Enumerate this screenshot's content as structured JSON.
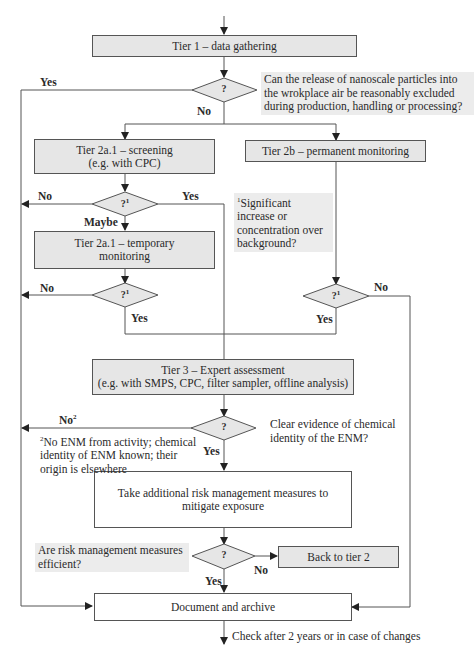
{
  "flowchart": {
    "tier1": {
      "label": "Tier 1 – data gathering"
    },
    "q1": {
      "symbol": "?",
      "question": "Can the release of nanoscale particles into the wrokplace air be reasonably excluded during production, handling or processing?",
      "yes": "Yes",
      "no": "No"
    },
    "tier2a_screening": {
      "line1": "Tier 2a.1 – screening",
      "line2": "(e.g. with CPC)"
    },
    "tier2b": {
      "label": "Tier 2b – permanent monitoring"
    },
    "q2": {
      "symbol": "?",
      "sup": "1",
      "no": "No",
      "yes": "Yes",
      "maybe": "Maybe"
    },
    "footnote1": {
      "sup": "1",
      "text": "Significant increase or concentration over background?"
    },
    "tier2a_temp": {
      "line1": "Tier 2a.1 – temporary",
      "line2": "monitoring"
    },
    "q3": {
      "symbol": "?",
      "sup": "1",
      "no": "No",
      "yes": "Yes"
    },
    "q4": {
      "symbol": "?",
      "sup": "1",
      "no": "No",
      "yes": "Yes"
    },
    "tier3": {
      "line1": "Tier 3 – Expert assessment",
      "line2": "(e.g. with SMPS, CPC, filter sampler, offline analysis)"
    },
    "q5": {
      "symbol": "?",
      "question": "Clear evidence of chemical identity of the ENM?",
      "no": "No",
      "no_sup": "2",
      "yes": "Yes"
    },
    "footnote2": {
      "sup": "2",
      "text": "No ENM from activity; chemical identity of ENM known; their origin is elsewhere"
    },
    "measures": {
      "line1": "Take additional risk management measures to",
      "line2": "mitigate exposure"
    },
    "q6": {
      "symbol": "?",
      "question": "Are risk management measures efficient?",
      "no": "No",
      "yes": "Yes"
    },
    "back": {
      "label": "Back to tier 2"
    },
    "document": {
      "label": "Document and archive"
    },
    "check": {
      "label": "Check after 2 years or in case of changes"
    }
  },
  "colors": {
    "box_fill": "#e6e6e6",
    "line": "#555555",
    "note_fill": "#ececec"
  }
}
